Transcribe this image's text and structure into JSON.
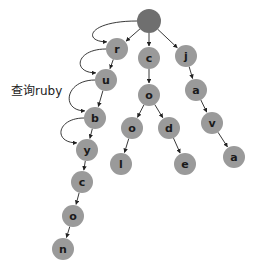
{
  "diagram": {
    "type": "trie",
    "query_label": "查询ruby",
    "colors": {
      "root_fill": "#6f6f6f",
      "node_fill": "#9a9a9a",
      "edge": "#222222",
      "text": "#1a1a1a"
    },
    "nodes": [
      {
        "id": "root",
        "label": "",
        "x": 149,
        "y": 21,
        "r": 12,
        "root": true
      },
      {
        "id": "r",
        "label": "r",
        "x": 117,
        "y": 49,
        "r": 11
      },
      {
        "id": "c1",
        "label": "c",
        "x": 149,
        "y": 58,
        "r": 11
      },
      {
        "id": "j",
        "label": "j",
        "x": 186,
        "y": 56,
        "r": 11
      },
      {
        "id": "u",
        "label": "u",
        "x": 106,
        "y": 80,
        "r": 11
      },
      {
        "id": "o1",
        "label": "o",
        "x": 149,
        "y": 95,
        "r": 11
      },
      {
        "id": "a1",
        "label": "a",
        "x": 196,
        "y": 90,
        "r": 11
      },
      {
        "id": "b",
        "label": "b",
        "x": 95,
        "y": 118,
        "r": 11
      },
      {
        "id": "o2",
        "label": "o",
        "x": 132,
        "y": 128,
        "r": 11
      },
      {
        "id": "d",
        "label": "d",
        "x": 169,
        "y": 128,
        "r": 11
      },
      {
        "id": "v",
        "label": "v",
        "x": 212,
        "y": 123,
        "r": 11
      },
      {
        "id": "y",
        "label": "y",
        "x": 87,
        "y": 150,
        "r": 11
      },
      {
        "id": "l",
        "label": "l",
        "x": 121,
        "y": 164,
        "r": 11
      },
      {
        "id": "e",
        "label": "e",
        "x": 185,
        "y": 164,
        "r": 11
      },
      {
        "id": "a2",
        "label": "a",
        "x": 234,
        "y": 157,
        "r": 11
      },
      {
        "id": "c2",
        "label": "c",
        "x": 82,
        "y": 182,
        "r": 11
      },
      {
        "id": "o3",
        "label": "o",
        "x": 73,
        "y": 216,
        "r": 11
      },
      {
        "id": "n",
        "label": "n",
        "x": 63,
        "y": 249,
        "r": 11
      }
    ],
    "edges": [
      {
        "from": "root",
        "to": "r"
      },
      {
        "from": "root",
        "to": "c1"
      },
      {
        "from": "root",
        "to": "j"
      },
      {
        "from": "r",
        "to": "u"
      },
      {
        "from": "u",
        "to": "b"
      },
      {
        "from": "b",
        "to": "y"
      },
      {
        "from": "y",
        "to": "c2"
      },
      {
        "from": "c2",
        "to": "o3"
      },
      {
        "from": "o3",
        "to": "n"
      },
      {
        "from": "c1",
        "to": "o1"
      },
      {
        "from": "o1",
        "to": "o2"
      },
      {
        "from": "o1",
        "to": "d"
      },
      {
        "from": "o2",
        "to": "l"
      },
      {
        "from": "d",
        "to": "e"
      },
      {
        "from": "j",
        "to": "a1"
      },
      {
        "from": "a1",
        "to": "v"
      },
      {
        "from": "v",
        "to": "a2"
      }
    ],
    "search_path": [
      {
        "from": "root",
        "to": "r"
      },
      {
        "from": "r",
        "to": "u"
      },
      {
        "from": "u",
        "to": "b"
      },
      {
        "from": "b",
        "to": "y"
      }
    ],
    "words": [
      "ruby",
      "rubycon",
      "cool",
      "code",
      "java"
    ]
  }
}
